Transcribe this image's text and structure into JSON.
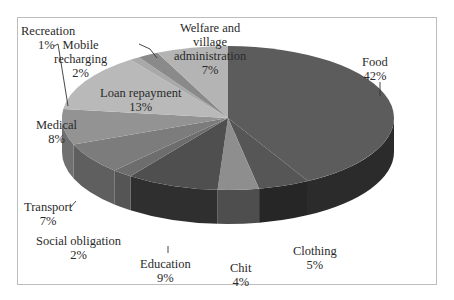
{
  "chart_data": {
    "type": "pie",
    "style": "3d-pie",
    "title": "",
    "start_angle": "12 o'clock",
    "direction": "clockwise",
    "slices": [
      {
        "label": "Food",
        "value": 42,
        "display": "42%",
        "top": "#5c5c5c",
        "side": "#2b2b2b"
      },
      {
        "label": "Clothing",
        "value": 5,
        "display": "5%",
        "top": "#565656",
        "side": "#262626"
      },
      {
        "label": "Chit",
        "value": 4,
        "display": "4%",
        "top": "#8e8e8e",
        "side": "#4e4e4e"
      },
      {
        "label": "Education",
        "value": 9,
        "display": "9%",
        "top": "#4f4f4f",
        "side": "#2f2f2f"
      },
      {
        "label": "Social obligation",
        "value": 2,
        "display": "2%",
        "top": "#6d6d6d",
        "side": "#555555"
      },
      {
        "label": "Transport",
        "value": 7,
        "display": "7%",
        "top": "#7c7c7c",
        "side": "#5f5f5f"
      },
      {
        "label": "Medical",
        "value": 8,
        "display": "8%",
        "top": "#939393",
        "side": "#707070"
      },
      {
        "label": "Loan repayment",
        "value": 13,
        "display": "13%",
        "top": "#b9b9b9",
        "side": "#8f8f8f"
      },
      {
        "label": "Recreation",
        "value": 1,
        "display": "1%",
        "top": "#a9a9a9",
        "side": "#858585"
      },
      {
        "label": "Mobile recharging",
        "value": 2,
        "display": "2%",
        "top": "#8a8a8a",
        "side": "#6a6a6a"
      },
      {
        "label": "Welfare and village administration",
        "value": 7,
        "display": "7%",
        "top": "#b4b4b4",
        "side": "#8c8c8c"
      }
    ],
    "legend": "none (data labels with category name and percentage)"
  },
  "labels": {
    "food": {
      "name": "Food",
      "pct": "42%"
    },
    "clothing": {
      "name": "Clothing",
      "pct": "5%"
    },
    "chit": {
      "name": "Chit",
      "pct": "4%"
    },
    "education": {
      "name": "Education",
      "pct": "9%"
    },
    "social": {
      "name": "Social obligation",
      "pct": "2%"
    },
    "transport": {
      "name": "Transport",
      "pct": "7%"
    },
    "medical": {
      "name": "Medical",
      "pct": "8%"
    },
    "loan": {
      "name": "Loan repayment",
      "pct": "13%"
    },
    "recreation": {
      "name": "Recreation",
      "pct": "1%"
    },
    "mobile": {
      "line1": "Mobile",
      "line2": "recharging",
      "pct": "2%"
    },
    "welfare": {
      "line1": "Welfare and",
      "line2": "village",
      "line3": "administration",
      "pct": "7%"
    }
  },
  "colors": {
    "frame": "#bdbdbd",
    "text": "#2a2a2a",
    "background": "#ffffff"
  }
}
